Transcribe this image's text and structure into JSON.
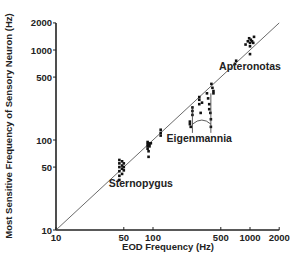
{
  "chart_data": {
    "type": "scatter",
    "title": "",
    "xlabel": "EOD Frequency (Hz)",
    "ylabel": "Most Sensitive Frequency of Sensory Neuron (Hz)",
    "xscale": "log",
    "yscale": "log",
    "xlim": [
      10,
      2000
    ],
    "ylim": [
      10,
      2000
    ],
    "xticks": [
      10,
      50,
      100,
      500,
      1000,
      2000
    ],
    "yticks": [
      10,
      50,
      100,
      500,
      1000,
      2000
    ],
    "grid": false,
    "reference_line": {
      "name": "identity (y = x)",
      "from": [
        10,
        10
      ],
      "to": [
        2000,
        2000
      ]
    },
    "annotations": [
      {
        "text": "Apteronotas",
        "x": 1000,
        "y": 600
      },
      {
        "text": "Eigenmannia",
        "x": 300,
        "y": 95
      },
      {
        "text": "Sternopygus",
        "x": 75,
        "y": 30
      }
    ],
    "series": [
      {
        "name": "Sternopygus",
        "points": [
          [
            45,
            60
          ],
          [
            45,
            55
          ],
          [
            45,
            50
          ],
          [
            45,
            45
          ],
          [
            45,
            40
          ],
          [
            45,
            36
          ],
          [
            48,
            58
          ],
          [
            48,
            52
          ],
          [
            48,
            48
          ],
          [
            48,
            42
          ],
          [
            50,
            55
          ],
          [
            50,
            50
          ],
          [
            50,
            46
          ]
        ]
      },
      {
        "name": "Sternopygus (higher EOD)",
        "points": [
          [
            88,
            95
          ],
          [
            88,
            90
          ],
          [
            88,
            85
          ],
          [
            88,
            80
          ],
          [
            90,
            92
          ],
          [
            90,
            88
          ],
          [
            90,
            75
          ],
          [
            90,
            65
          ],
          [
            92,
            90
          ],
          [
            92,
            85
          ],
          [
            95,
            92
          ],
          [
            120,
            130
          ],
          [
            120,
            120
          ],
          [
            120,
            112
          ]
        ]
      },
      {
        "name": "Eigenmannia",
        "points": [
          [
            240,
            160
          ],
          [
            240,
            150
          ],
          [
            245,
            140
          ],
          [
            255,
            230
          ],
          [
            255,
            210
          ],
          [
            255,
            190
          ],
          [
            300,
            300
          ],
          [
            300,
            280
          ],
          [
            300,
            250
          ],
          [
            310,
            200
          ],
          [
            320,
            260
          ],
          [
            360,
            330
          ],
          [
            370,
            290
          ],
          [
            380,
            250
          ],
          [
            380,
            220
          ],
          [
            390,
            200
          ],
          [
            395,
            170
          ],
          [
            395,
            140
          ],
          [
            400,
            420
          ],
          [
            410,
            380
          ],
          [
            420,
            350
          ],
          [
            420,
            330
          ]
        ]
      },
      {
        "name": "Apteronotas",
        "points": [
          [
            700,
            700
          ],
          [
            720,
            760
          ],
          [
            900,
            1150
          ],
          [
            950,
            1250
          ],
          [
            980,
            1350
          ],
          [
            1000,
            1200
          ],
          [
            1000,
            1100
          ],
          [
            1020,
            1300
          ],
          [
            1050,
            1250
          ],
          [
            1080,
            1200
          ],
          [
            1100,
            1400
          ],
          [
            1000,
            900
          ]
        ]
      }
    ]
  }
}
